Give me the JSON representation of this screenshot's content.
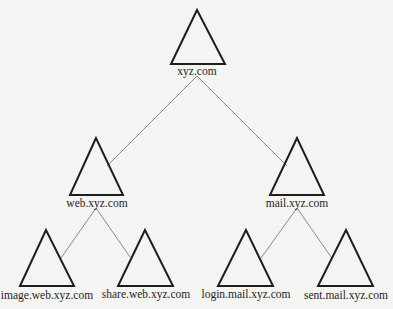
{
  "diagram": {
    "type": "tree",
    "nodes": [
      {
        "id": "root",
        "label": "xyz.com",
        "level": 0,
        "parent": null
      },
      {
        "id": "web",
        "label": "web.xyz.com",
        "level": 1,
        "parent": "root"
      },
      {
        "id": "mail",
        "label": "mail.xyz.com",
        "level": 1,
        "parent": "root"
      },
      {
        "id": "image",
        "label": "image.web.xyz.com",
        "level": 2,
        "parent": "web"
      },
      {
        "id": "share",
        "label": "share.web.xyz.com",
        "level": 2,
        "parent": "web"
      },
      {
        "id": "login",
        "label": "login.mail.xyz.com",
        "level": 2,
        "parent": "mail"
      },
      {
        "id": "sent",
        "label": "sent.mail.xyz.com",
        "level": 2,
        "parent": "mail"
      }
    ],
    "edges": [
      {
        "from": "root",
        "to": "web"
      },
      {
        "from": "root",
        "to": "mail"
      },
      {
        "from": "web",
        "to": "image"
      },
      {
        "from": "web",
        "to": "share"
      },
      {
        "from": "mail",
        "to": "login"
      },
      {
        "from": "mail",
        "to": "sent"
      }
    ],
    "node_shape": "triangle-icon",
    "colors": {
      "triangle": "#1e1e1e",
      "edge": "#8a8a8a",
      "background": "#f4f4f2",
      "text": "#1f1f1f"
    }
  }
}
